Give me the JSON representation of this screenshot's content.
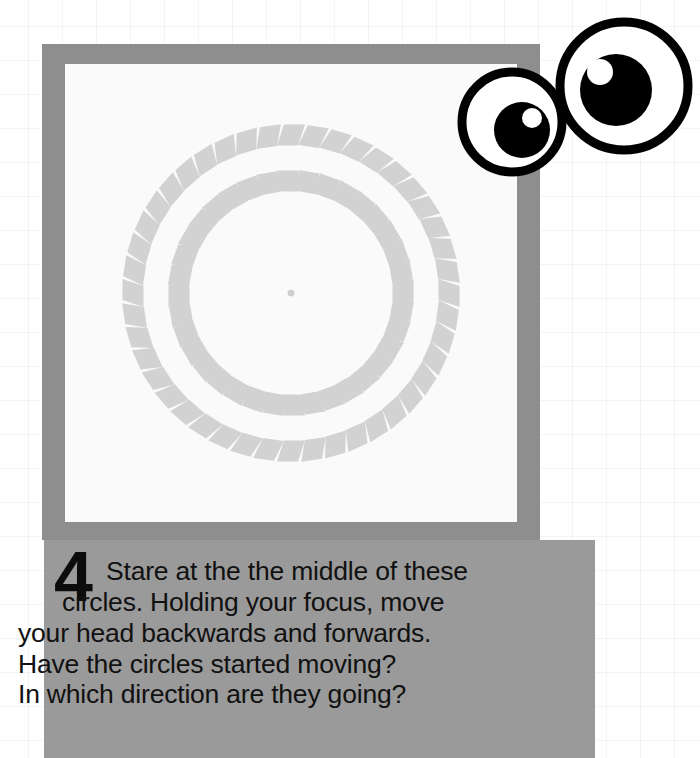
{
  "page": {
    "background_color": "#ffffff",
    "grid_line_color": "#f0f0f0",
    "grid_spacing_px": 34
  },
  "illusion": {
    "name": "rotating-circles-illusion",
    "frame_color": "#8e8e8e",
    "plate_color": "#fafafa",
    "tile_color": "#d2d2d2",
    "center_dot_color": "#cfcfcf",
    "rings": [
      {
        "name": "inner-ring",
        "radius_px": 112,
        "tile_count": 36,
        "tile_size_px": 21,
        "skew_deg": 18
      },
      {
        "name": "outer-ring",
        "radius_px": 158,
        "tile_count": 44,
        "tile_size_px": 21,
        "skew_deg": -18
      }
    ],
    "center_dot_radius_px": 3.5
  },
  "caption": {
    "block_color": "#9a9a9a",
    "text_color": "#111111",
    "step_number": "4",
    "line1": "Stare at the the middle of these",
    "line2": "circles. Holding your focus, move",
    "line3": "your head backwards and forwards.",
    "line4": "Have the circles started moving?",
    "line5": "In which direction are they going?",
    "full_text": "Stare at the the middle of these circles. Holding your focus, move your head backwards and forwards. Have the circles started moving? In which direction are they going?"
  },
  "eyes": {
    "name": "googly-eyes-illustration",
    "outline_color": "#000000",
    "sclera_color": "#ffffff",
    "pupil_color": "#000000",
    "highlight_color": "#ffffff",
    "left_eye": {
      "cx": 62,
      "cy": 116,
      "r": 50,
      "pupil_r": 28,
      "pupil_cx": 72,
      "pupil_cy": 124,
      "hl_r": 10,
      "hl_cx": 82,
      "hl_cy": 112
    },
    "right_eye": {
      "cx": 174,
      "cy": 80,
      "r": 64,
      "pupil_r": 36,
      "pupil_cx": 166,
      "pupil_cy": 84,
      "hl_r": 13,
      "hl_cx": 150,
      "hl_cy": 66
    }
  }
}
